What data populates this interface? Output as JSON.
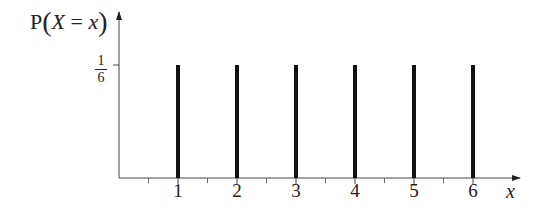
{
  "chart_data": {
    "type": "bar",
    "title": "",
    "xlabel": "x",
    "ylabel": "P(X = x)",
    "categories": [
      "1",
      "2",
      "3",
      "4",
      "5",
      "6"
    ],
    "values": [
      0.1667,
      0.1667,
      0.1667,
      0.1667,
      0.1667,
      0.1667
    ],
    "value_labels": [
      "1/6",
      "1/6",
      "1/6",
      "1/6",
      "1/6",
      "1/6"
    ],
    "y_ticks": [
      {
        "value": 0.1667,
        "label": "1/6",
        "numerator": "1",
        "denominator": "6"
      }
    ],
    "x_ticks": [
      "1",
      "2",
      "3",
      "4",
      "5",
      "6"
    ],
    "x_minor_ticks": [
      0.5,
      1.5,
      2.5,
      3.5,
      4.5,
      5.5
    ],
    "xlim": [
      0,
      6.7
    ],
    "ylim": [
      0,
      0.2
    ],
    "grid": false,
    "legend": null,
    "style": "stick plot (discrete uniform distribution)"
  },
  "labels": {
    "y_axis_prefix": "P",
    "y_axis_var": "X",
    "y_axis_eq": " = ",
    "y_axis_val": "x",
    "x_axis": "x",
    "ytick_num": "1",
    "ytick_den": "6"
  }
}
